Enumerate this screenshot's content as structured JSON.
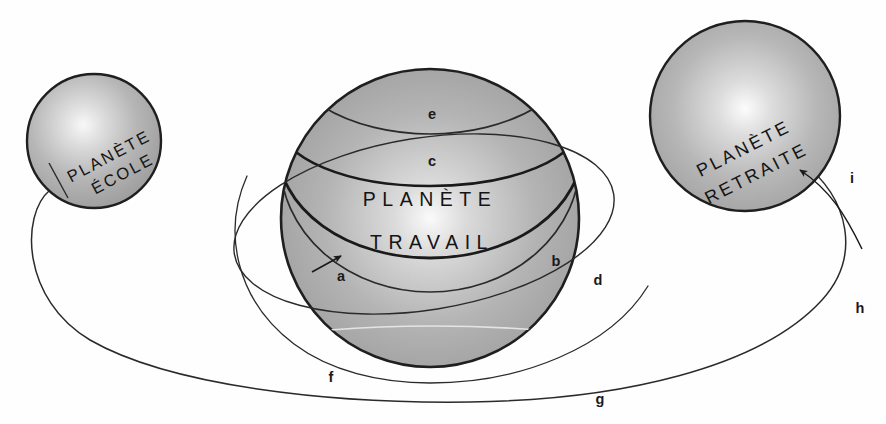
{
  "diagram": {
    "title_absent": true,
    "background_color": "#fefefe",
    "stroke_color": "#1a1a1a",
    "sphere_edge_color": "#9b9b9b",
    "sphere_center_color": "#f6f6f6",
    "sphere_mid_color": "#bdbdbd",
    "planets": [
      {
        "id": "planete-ecole",
        "line1": "PLANÈTE",
        "line2": "ÉCOLE",
        "cx": 94,
        "cy": 141,
        "r": 67,
        "text_rotation": -28
      },
      {
        "id": "planete-travail",
        "line1": "PLANÈTE",
        "line2": "TRAVAIL",
        "cx": 430,
        "cy": 218,
        "r": 149,
        "text_rotation": 0
      },
      {
        "id": "planete-retraite",
        "line1": "PLANÈTE",
        "line2": "RETRAITE",
        "cx": 745,
        "cy": 116,
        "r": 95,
        "text_rotation": -27
      }
    ],
    "labels": [
      {
        "id": "a",
        "text": "a",
        "x": 341,
        "y": 281
      },
      {
        "id": "b",
        "text": "b",
        "x": 556,
        "y": 266
      },
      {
        "id": "c",
        "text": "c",
        "x": 432,
        "y": 166
      },
      {
        "id": "d",
        "text": "d",
        "x": 598,
        "y": 285
      },
      {
        "id": "e",
        "text": "e",
        "x": 432,
        "y": 119
      },
      {
        "id": "f",
        "text": "f",
        "x": 331,
        "y": 382
      },
      {
        "id": "g",
        "text": "g",
        "x": 600,
        "y": 404
      },
      {
        "id": "h",
        "text": "h",
        "x": 860,
        "y": 313
      },
      {
        "id": "i",
        "text": "i",
        "x": 852,
        "y": 183
      }
    ]
  }
}
